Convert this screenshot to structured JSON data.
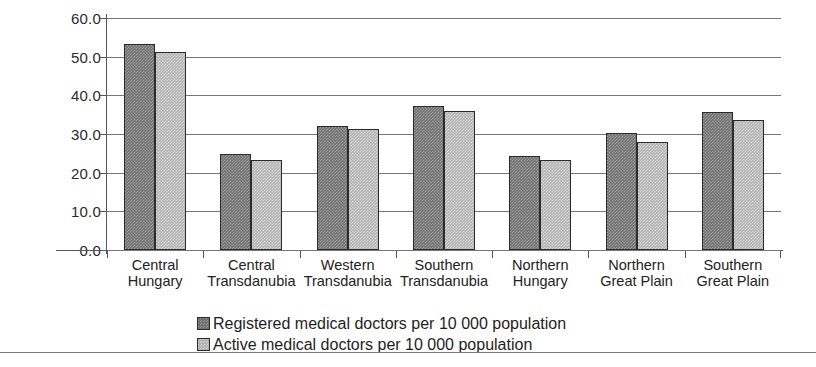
{
  "chart_data": {
    "type": "bar",
    "title": "",
    "subtitle": "",
    "xlabel": "",
    "ylabel": "",
    "ylim": [
      0,
      60
    ],
    "yticks": [
      "0.0",
      "10.0",
      "20.0",
      "30.0",
      "40.0",
      "50.0",
      "60.0"
    ],
    "ytick_values": [
      0,
      10,
      20,
      30,
      40,
      50,
      60
    ],
    "grid": true,
    "legend_position": "bottom-left",
    "categories": [
      "Central Hungary",
      "Central Transdanubia",
      "Western Transdanubia",
      "Southern Transdanubia",
      "Northern Hungary",
      "Northern Great Plain",
      "Southern Great Plain"
    ],
    "category_lines": [
      [
        "Central",
        "Hungary"
      ],
      [
        "Central",
        "Transdanubia"
      ],
      [
        "Western",
        "Transdanubia"
      ],
      [
        "Southern",
        "Transdanubia"
      ],
      [
        "Northern",
        "Hungary"
      ],
      [
        "Northern",
        "Great Plain"
      ],
      [
        "Southern",
        "Great Plain"
      ]
    ],
    "series": [
      {
        "name": "Registered medical doctors per 10 000 population",
        "key": "registered",
        "color": "#6f6f6f",
        "values": [
          53.2,
          24.8,
          32.2,
          37.2,
          24.3,
          30.2,
          35.7
        ]
      },
      {
        "name": "Active medical doctors per 10 000 population",
        "key": "active",
        "color": "#b2b2b2",
        "values": [
          51.2,
          23.2,
          31.3,
          35.9,
          23.3,
          28.0,
          33.5
        ]
      }
    ]
  },
  "legend": [
    {
      "label": "Registered medical doctors per 10 000 population",
      "swatch": "registered"
    },
    {
      "label": "Active medical doctors per 10 000 population",
      "swatch": "active"
    }
  ],
  "colors": {
    "registered": "#6f6f6f",
    "active": "#b2b2b2",
    "axis": "#555555",
    "grid": "#777777",
    "text": "#1a1a1a"
  }
}
